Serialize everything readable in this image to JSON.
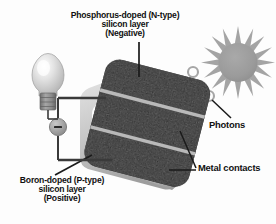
{
  "diagram": {
    "background_color": "#fdfdfd",
    "labels": {
      "ntype": {
        "line1": "Phosphorus-doped (N-type)",
        "line2": "silicon layer",
        "line3": "(Negative)"
      },
      "ptype": {
        "line1": "Boron-doped (P-type)",
        "line2": "silicon layer",
        "line3": "(Positive)"
      },
      "photons": "Photons",
      "metal_contacts": "Metal contacts"
    },
    "electron": {
      "symbol": "–",
      "meaning": "electron-negative-charge"
    },
    "colors": {
      "panel_dark": "#262626",
      "panel_edge_light": "#c9c9c9",
      "contact_stripe": "#b5b5b5",
      "sun_gray": "#9a9a9a",
      "sun_ray_gray": "#a8a8a8",
      "photon_ring": "#a9a9a9",
      "bulb_glass": "#d8d8d8",
      "bulb_base": "#8d8d8d",
      "wire": "#3a3a3a",
      "text": "#111111"
    },
    "counts": {
      "sun_rays": 12,
      "photons": 3,
      "metal_contact_stripes": 2
    }
  }
}
